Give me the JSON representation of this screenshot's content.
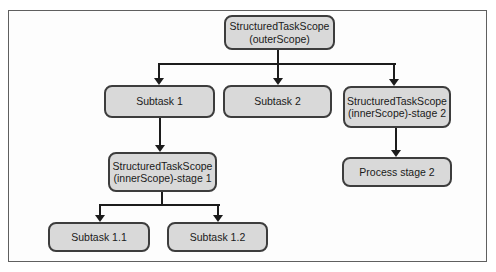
{
  "figure": {
    "nodes": {
      "outer_scope": {
        "line1": "StructuredTaskScope",
        "line2": "(outerScope)"
      },
      "subtask_1": {
        "line1": "Subtask 1"
      },
      "subtask_2": {
        "line1": "Subtask 2"
      },
      "inner_scope_stage_2": {
        "line1": "StructuredTaskScope",
        "line2": "(innerScope)-stage 2"
      },
      "inner_scope_stage_1": {
        "line1": "StructuredTaskScope",
        "line2": "(innerScope)-stage 1"
      },
      "process_stage_2": {
        "line1": "Process stage 2"
      },
      "subtask_1_1": {
        "line1": "Subtask 1.1"
      },
      "subtask_1_2": {
        "line1": "Subtask 1.2"
      }
    },
    "colors": {
      "page_bg": "#ffffff",
      "canvas_bg": "#fdfdfd",
      "frame_border": "#5f5f5f",
      "node_fill": "#d9d9d9",
      "node_border": "#3d3d3d",
      "connector": "#1c1c1c",
      "text": "#1a1a1a"
    }
  }
}
